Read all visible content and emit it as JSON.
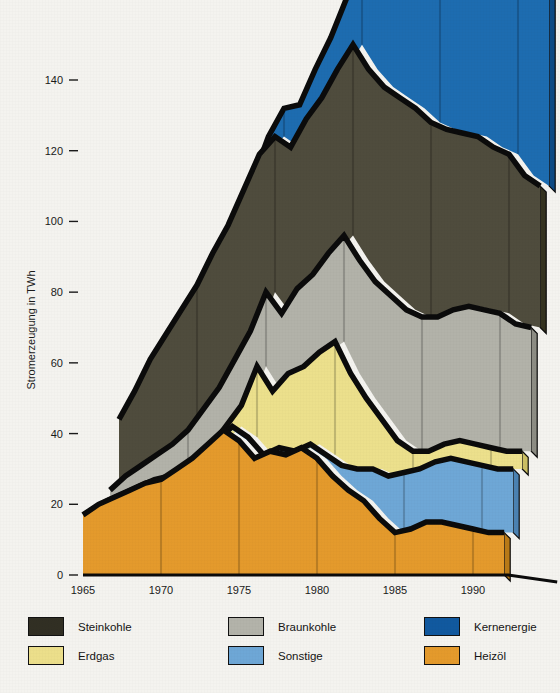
{
  "chart_data": {
    "type": "area",
    "subtype": "stacked-area-3d-perspective",
    "title": "",
    "xlabel": "",
    "ylabel": "Stromerzeugung in TWh",
    "xlim": [
      1965,
      1992
    ],
    "ylim": [
      0,
      150
    ],
    "yticks": [
      0,
      20,
      40,
      60,
      80,
      100,
      120,
      140
    ],
    "ytick_labels": [
      "0",
      "20",
      "40",
      "60",
      "80",
      "100",
      "120",
      "140"
    ],
    "xticks": [
      1965,
      1970,
      1975,
      1980,
      1985,
      1990
    ],
    "xtick_labels": [
      "1965",
      "1970",
      "1975",
      "1980",
      "1985",
      "1990"
    ],
    "grid": "vertical-only",
    "legend_position": "below",
    "stack_order_bottom_to_top": [
      "Heizöl",
      "Sonstige",
      "Erdgas",
      "Braunkohle",
      "Steinkohle",
      "Kernenergie"
    ],
    "x": [
      1965,
      1966,
      1967,
      1968,
      1969,
      1970,
      1971,
      1972,
      1973,
      1974,
      1975,
      1976,
      1977,
      1978,
      1979,
      1980,
      1981,
      1982,
      1983,
      1984,
      1985,
      1986,
      1987,
      1988,
      1989,
      1990,
      1991,
      1992
    ],
    "series": [
      {
        "name": "Heizöl",
        "color": "#e49a2c",
        "side_color": "#b97a17",
        "values": [
          17,
          20,
          22,
          24,
          26,
          27,
          30,
          33,
          37,
          41,
          38,
          33,
          35,
          34,
          36,
          33,
          28,
          24,
          21,
          16,
          12,
          13,
          15,
          15,
          14,
          13,
          12,
          12
        ]
      },
      {
        "name": "Sonstige",
        "color": "#6ea7d6",
        "side_color": "#4b82b2",
        "values": [
          1,
          1,
          1,
          1,
          1,
          1,
          1,
          1,
          1,
          1,
          1,
          1,
          1,
          1,
          1,
          1,
          3,
          6,
          9,
          12,
          17,
          17,
          17,
          18,
          18,
          18,
          18,
          18
        ]
      },
      {
        "name": "Erdgas",
        "color": "#ece08c",
        "side_color": "#cbbf63",
        "values": [
          0,
          0,
          0,
          0,
          0,
          0,
          1,
          2,
          4,
          6,
          20,
          18,
          21,
          24,
          26,
          32,
          26,
          20,
          14,
          10,
          6,
          5,
          5,
          5,
          5,
          5,
          5,
          5
        ]
      },
      {
        "name": "Braunkohle",
        "color": "#b2b2a9",
        "side_color": "#8d8d84",
        "values": [
          6,
          7,
          8,
          9,
          10,
          13,
          15,
          17,
          19,
          21,
          21,
          22,
          24,
          26,
          28,
          30,
          32,
          33,
          35,
          37,
          38,
          38,
          38,
          38,
          38,
          38,
          36,
          35
        ]
      },
      {
        "name": "Steinkohle",
        "color": "#4f4c3d",
        "side_color": "#34321f",
        "values": [
          20,
          24,
          30,
          34,
          38,
          41,
          44,
          46,
          48,
          50,
          44,
          47,
          48,
          50,
          52,
          54,
          54,
          55,
          56,
          57,
          55,
          53,
          50,
          48,
          46,
          45,
          42,
          40
        ]
      },
      {
        "name": "Kernenergie",
        "color": "#1d6cb0",
        "side_color": "#0d4a84",
        "values": [
          0,
          0,
          0,
          0,
          0,
          1,
          1,
          2,
          3,
          5,
          8,
          12,
          14,
          17,
          20,
          22,
          30,
          40,
          50,
          62,
          78,
          90,
          95,
          105,
          110,
          120,
          126,
          118
        ]
      }
    ]
  },
  "axis": {
    "ylabel": "Stromerzeugung in TWh"
  },
  "legend": {
    "columns": [
      {
        "entries": [
          {
            "label": "Steinkohle",
            "color": "#312f23",
            "swatch": "legend-swatch-steinkohle"
          },
          {
            "label": "Erdgas",
            "color": "#ecdf8b",
            "swatch": "legend-swatch-erdgas"
          }
        ]
      },
      {
        "entries": [
          {
            "label": "Braunkohle",
            "color": "#b3b3aa",
            "swatch": "legend-swatch-braunkohle"
          },
          {
            "label": "Sonstige",
            "color": "#6ea7d6",
            "swatch": "legend-swatch-sonstige"
          }
        ]
      },
      {
        "entries": [
          {
            "label": "Kernenergie",
            "color": "#11599f",
            "swatch": "legend-swatch-kernenergie"
          },
          {
            "label": "Heizöl",
            "color": "#e49a2c",
            "swatch": "legend-swatch-heizoel"
          }
        ]
      }
    ]
  }
}
